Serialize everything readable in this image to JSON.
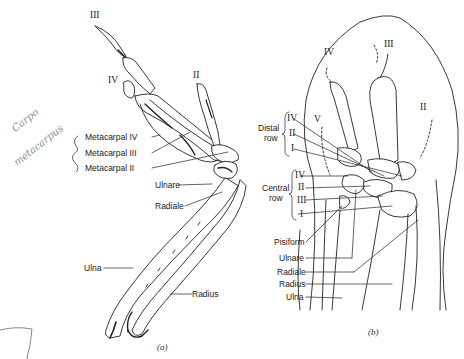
{
  "figure": {
    "panel_a": {
      "caption": "(a)",
      "digit_labels": {
        "d3": "III",
        "d4": "IV",
        "d2": "II"
      },
      "labels": {
        "metacarpal4": "Metacarpal IV",
        "metacarpal3": "Metacarpal III",
        "metacarpal2": "Metacarpal II",
        "ulnare": "Ulnare",
        "radiale": "Radiale",
        "ulna": "Ulna",
        "radius": "Radius"
      },
      "handwritten_note": {
        "line1": "Carpo",
        "line2": "metacarpus"
      }
    },
    "panel_b": {
      "caption": "(b)",
      "digit_labels": {
        "d4": "IV",
        "d3": "III",
        "d2": "II",
        "d5": "V"
      },
      "distal_row": {
        "title_line1": "Distal",
        "title_line2": "row",
        "items": [
          "IV",
          "II",
          "I"
        ]
      },
      "central_row": {
        "title_line1": "Central",
        "title_line2": "row",
        "items": [
          "IV",
          "II",
          "III",
          "I"
        ]
      },
      "labels": {
        "pisiform": "Pisiform",
        "ulnare": "Ulnare",
        "radiale": "Radiale",
        "radius": "Radius",
        "ulna": "Ulna"
      }
    },
    "colors": {
      "ink": "#222222",
      "pencil": "#8a8f9a",
      "background": "#ffffff"
    }
  }
}
